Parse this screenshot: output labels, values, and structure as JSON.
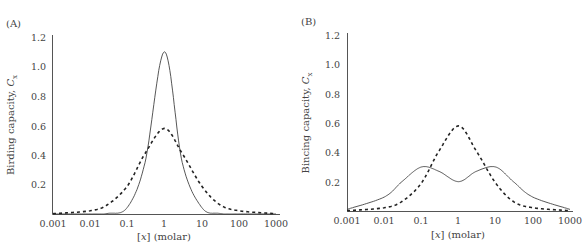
{
  "chart_data": [
    {
      "panel_label": "(A)",
      "type": "line",
      "title": "",
      "xlabel": "[x] (molar)",
      "xlabel_var": "x",
      "xlabel_unit": "(molar)",
      "ylabel": "Birding capacity, C_x",
      "ylabel_text": "Birding capacity, ",
      "ylabel_symbol": "C",
      "ylabel_sub": "x",
      "xscale": "log",
      "xlim": [
        0.001,
        1000
      ],
      "ylim": [
        0,
        1.2
      ],
      "grid": false,
      "x_ticks": [
        "0.001",
        "0.01",
        "0.1",
        "1",
        "10",
        "100",
        "1000"
      ],
      "y_ticks": [
        "0.2",
        "0.4",
        "0.6",
        "0.8",
        "1.0",
        "1.2"
      ],
      "x": [
        0.001,
        0.01,
        0.03,
        0.1,
        0.3,
        1,
        3,
        10,
        30,
        100,
        1000
      ],
      "series": [
        {
          "name": "solid",
          "style": "solid",
          "values": [
            0.0,
            0.0,
            0.004,
            0.045,
            0.35,
            1.1,
            0.35,
            0.045,
            0.004,
            0.0,
            0.0
          ]
        },
        {
          "name": "dashed",
          "style": "dashed",
          "values": [
            0.002,
            0.022,
            0.065,
            0.19,
            0.41,
            0.58,
            0.41,
            0.19,
            0.065,
            0.022,
            0.002
          ]
        }
      ],
      "legend": "none"
    },
    {
      "panel_label": "(B)",
      "type": "line",
      "title": "",
      "xlabel": "[x] (molar)",
      "xlabel_var": "x",
      "xlabel_unit": "(molar)",
      "ylabel": "Bincing capacity, C_x",
      "ylabel_text": "Bincing capacity, ",
      "ylabel_symbol": "C",
      "ylabel_sub": "x",
      "xscale": "log",
      "xlim": [
        0.001,
        1000
      ],
      "ylim": [
        0,
        1.2
      ],
      "grid": false,
      "x_ticks": [
        "0.001",
        "0.01",
        "0.1",
        "1",
        "10",
        "100",
        "1000"
      ],
      "y_ticks": [
        "0.2",
        "0.4",
        "0.6",
        "0.8",
        "1.0",
        "1.2"
      ],
      "x": [
        0.001,
        0.01,
        0.03,
        0.1,
        0.3,
        1,
        3,
        10,
        30,
        100,
        1000
      ],
      "series": [
        {
          "name": "solid",
          "style": "solid",
          "values": [
            0.011,
            0.095,
            0.2,
            0.3,
            0.27,
            0.2,
            0.27,
            0.3,
            0.2,
            0.095,
            0.011
          ]
        },
        {
          "name": "dashed",
          "style": "dashed",
          "values": [
            0.002,
            0.022,
            0.065,
            0.19,
            0.41,
            0.58,
            0.41,
            0.19,
            0.065,
            0.022,
            0.002
          ]
        }
      ],
      "legend": "none"
    }
  ]
}
